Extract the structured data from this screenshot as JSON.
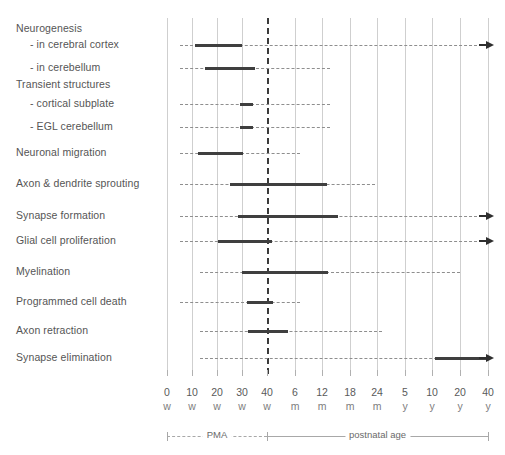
{
  "chart_data": {
    "type": "bar",
    "orientation": "horizontal-timeline",
    "title": "",
    "xlabel": "",
    "ylabel": "",
    "grid": true,
    "legend_position": "bottom",
    "axis": {
      "tick_positions_px": [
        167,
        192,
        217,
        242,
        267,
        295,
        322,
        350,
        377,
        405,
        432,
        460,
        488
      ],
      "ticks": [
        {
          "value": "0",
          "unit": "w"
        },
        {
          "value": "10",
          "unit": "w"
        },
        {
          "value": "20",
          "unit": "w"
        },
        {
          "value": "30",
          "unit": "w"
        },
        {
          "value": "40",
          "unit": "w"
        },
        {
          "value": "6",
          "unit": "m"
        },
        {
          "value": "12",
          "unit": "m"
        },
        {
          "value": "18",
          "unit": "m"
        },
        {
          "value": "24",
          "unit": "m"
        },
        {
          "value": "5",
          "unit": "y"
        },
        {
          "value": "10",
          "unit": "y"
        },
        {
          "value": "20",
          "unit": "y"
        },
        {
          "value": "40",
          "unit": "y"
        }
      ],
      "emphasized_tick_index": 4,
      "periods": [
        {
          "name": "PMA",
          "style": "dashed",
          "from_index": 0,
          "to_index": 4
        },
        {
          "name": "postnatal age",
          "style": "solid",
          "from_index": 4,
          "to_index": 12
        }
      ]
    },
    "categories": [
      "Neurogenesis",
      "-  in cerebral cortex",
      "-  in cerebellum",
      "Transient structures",
      "-  cortical subplate",
      "-  EGL cerebellum",
      "Neuronal migration",
      "Axon & dendrite sprouting",
      "Synapse formation",
      "Glial cell proliferation",
      "Myelination",
      "Programmed cell death",
      "Axon retraction",
      "Synapse elimination"
    ],
    "rows": [
      {
        "label": "Neurogenesis",
        "header": true,
        "indent": false,
        "y": 29,
        "has_track": false,
        "bar": null,
        "arrow": false
      },
      {
        "label": "-  in cerebral cortex",
        "header": false,
        "indent": true,
        "y": 45,
        "has_track": true,
        "track_from": 180,
        "track_to": 482,
        "bar": {
          "start": 195,
          "end": 242,
          "start_label": "10 w",
          "end_label": "30 w"
        },
        "arrow": true
      },
      {
        "label": "-  in cerebellum",
        "header": false,
        "indent": true,
        "y": 68,
        "has_track": true,
        "track_from": 180,
        "track_to": 330,
        "bar": {
          "start": 205,
          "end": 255,
          "start_label": "15 w",
          "end_label": "35 w"
        },
        "arrow": false
      },
      {
        "label": "Transient structures",
        "header": true,
        "indent": false,
        "y": 85,
        "has_track": false,
        "bar": null,
        "arrow": false
      },
      {
        "label": "-  cortical subplate",
        "header": false,
        "indent": true,
        "y": 104,
        "has_track": true,
        "track_from": 180,
        "track_to": 330,
        "bar": {
          "start": 240,
          "end": 253,
          "start_label": "29 w",
          "end_label": "35 w"
        },
        "arrow": false
      },
      {
        "label": "-  EGL cerebellum",
        "header": false,
        "indent": true,
        "y": 127,
        "has_track": true,
        "track_from": 180,
        "track_to": 330,
        "bar": {
          "start": 240,
          "end": 253,
          "start_label": "29 w",
          "end_label": "35 w"
        },
        "arrow": false
      },
      {
        "label": "Neuronal migration",
        "header": false,
        "indent": false,
        "y": 153,
        "has_track": true,
        "track_from": 180,
        "track_to": 300,
        "bar": {
          "start": 198,
          "end": 243,
          "start_label": "12 w",
          "end_label": "30 w"
        },
        "arrow": false
      },
      {
        "label": "Axon & dendrite sprouting",
        "header": false,
        "indent": false,
        "y": 184,
        "has_track": true,
        "track_from": 180,
        "track_to": 375,
        "bar": {
          "start": 230,
          "end": 327,
          "start_label": "25 w",
          "end_label": "12 m"
        },
        "arrow": false
      },
      {
        "label": "Synapse formation",
        "header": false,
        "indent": false,
        "y": 216,
        "has_track": true,
        "track_from": 180,
        "track_to": 482,
        "bar": {
          "start": 238,
          "end": 338,
          "start_label": "28 w",
          "end_label": "15 m"
        },
        "arrow": true
      },
      {
        "label": "Glial cell proliferation",
        "header": false,
        "indent": false,
        "y": 241,
        "has_track": true,
        "track_from": 180,
        "track_to": 482,
        "bar": {
          "start": 218,
          "end": 272,
          "start_label": "20 w",
          "end_label": "42 w"
        },
        "arrow": true
      },
      {
        "label": "Myelination",
        "header": false,
        "indent": false,
        "y": 272,
        "has_track": true,
        "track_from": 200,
        "track_to": 460,
        "bar": {
          "start": 242,
          "end": 328,
          "start_label": "30 w",
          "end_label": "12 m"
        },
        "arrow": false
      },
      {
        "label": "Programmed cell death",
        "header": false,
        "indent": false,
        "y": 302,
        "has_track": true,
        "track_from": 180,
        "track_to": 300,
        "bar": {
          "start": 247,
          "end": 273,
          "start_label": "32 w",
          "end_label": "42 w"
        },
        "arrow": false
      },
      {
        "label": "Axon retraction",
        "header": false,
        "indent": false,
        "y": 331,
        "has_track": true,
        "track_from": 200,
        "track_to": 382,
        "bar": {
          "start": 248,
          "end": 288,
          "start_label": "32 w",
          "end_label": "4 m"
        },
        "arrow": false
      },
      {
        "label": "Synapse elimination",
        "header": false,
        "indent": false,
        "y": 358,
        "has_track": true,
        "track_from": 200,
        "track_to": 482,
        "bar": {
          "start": 435,
          "end": 487,
          "start_label": "11 y",
          "end_label": "40 y"
        },
        "arrow": true
      }
    ],
    "colors": {
      "bar": "#3f3f3f",
      "track": "#8e8e8e",
      "grid": "#cfcfcf",
      "grid_emphasis": "#3a3a3a",
      "text": "#555555",
      "axis": "#a8a8a8",
      "background": "#ffffff"
    }
  }
}
